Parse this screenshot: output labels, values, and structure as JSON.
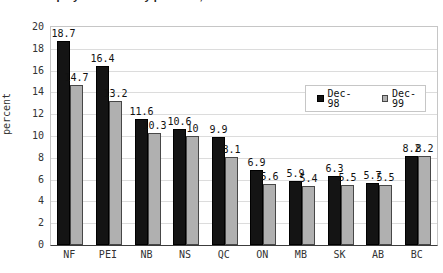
{
  "figure": {
    "cropped_title": "Unemployment rates by province, December 1998 and December 1999",
    "background": "#ffffff"
  },
  "chart_data": {
    "type": "bar",
    "categories": [
      "NF",
      "PEI",
      "NB",
      "NS",
      "QC",
      "ON",
      "MB",
      "SK",
      "AB",
      "BC"
    ],
    "series": [
      {
        "name": "Dec-98",
        "color": "#141414",
        "values": [
          18.7,
          16.4,
          11.6,
          10.6,
          9.9,
          6.9,
          5.9,
          6.3,
          5.7,
          8.2
        ],
        "labels": [
          "18.7",
          "16.4",
          "11.6",
          "10.6",
          "9.9",
          "6.9",
          "5.9",
          "6.3",
          "5.7",
          "8.2"
        ]
      },
      {
        "name": "Dec-99",
        "color": "#b0b0b0",
        "values": [
          14.7,
          13.2,
          10.3,
          10,
          8.1,
          5.6,
          5.4,
          5.5,
          5.5,
          8.2
        ],
        "labels": [
          "14.7",
          "13.2",
          "10.3",
          "10",
          "8.1",
          "5.6",
          "5.4",
          "5.5",
          "5.5",
          "8.2"
        ]
      }
    ],
    "xlabel": "",
    "ylabel": "percent",
    "ylim": [
      0,
      20
    ],
    "ytick_step": 2,
    "yticks": [
      "0",
      "2",
      "4",
      "6",
      "8",
      "10",
      "12",
      "14",
      "16",
      "18",
      "20"
    ],
    "grid": true,
    "legend_position": "inside-top-right",
    "series_colors": [
      "#141414",
      "#b0b0b0"
    ],
    "gridline_color": "#dcdcdc"
  }
}
